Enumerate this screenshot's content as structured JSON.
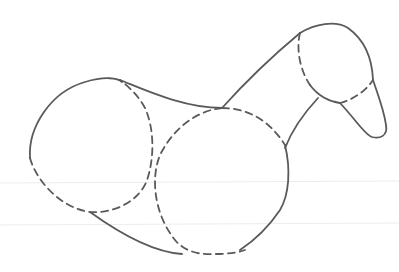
{
  "drawing": {
    "subject": "Construction sketch of an animal body (horse/duck-like) built from overlapping circles",
    "style": "line sketch, solid outlines with dashed construction circles",
    "stroke_color": "#5a5a5a",
    "background_color": "#ffffff",
    "rule_line_color": "#ececec",
    "parts": [
      "hindquarter-circle",
      "chest-circle",
      "neck",
      "head-circle",
      "muzzle"
    ]
  }
}
